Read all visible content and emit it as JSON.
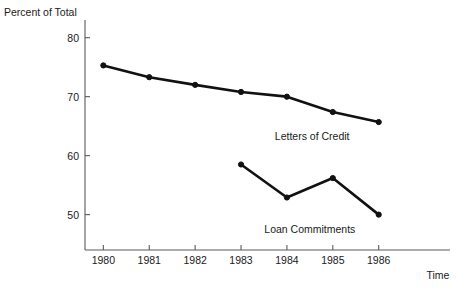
{
  "chart_data": {
    "type": "line",
    "title": "",
    "xlabel": "Time",
    "ylabel": "Percent of Total",
    "x": [
      1980,
      1981,
      1982,
      1983,
      1984,
      1985,
      1986
    ],
    "categories": [
      "1980",
      "1981",
      "1982",
      "1983",
      "1984",
      "1985",
      "1986"
    ],
    "xtick_labels": [
      "1980",
      "1981",
      "1982",
      "1983",
      "1984",
      "1985",
      "1986"
    ],
    "ytick_labels": [
      "80",
      "70",
      "60",
      "50"
    ],
    "yticks": [
      80,
      70,
      60,
      50
    ],
    "ylim": [
      44,
      83
    ],
    "xlim": [
      1979.6,
      1986.9
    ],
    "grid": false,
    "legend_position": "inline-annotation",
    "series": [
      {
        "name": "Letters of Credit",
        "x": [
          1980,
          1981,
          1982,
          1983,
          1984,
          1985,
          1986
        ],
        "values": [
          75.3,
          73.3,
          72.0,
          70.8,
          70.0,
          67.4,
          65.7
        ],
        "color": "#111111",
        "label_x": 1984.55,
        "label_y": 62.6
      },
      {
        "name": "Loan Commitments",
        "x": [
          1983,
          1984,
          1985,
          1986
        ],
        "values": [
          58.5,
          52.9,
          56.2,
          50.0
        ],
        "color": "#111111",
        "label_x": 1984.5,
        "label_y": 46.8
      }
    ],
    "annotations": [
      {
        "text": "Letters of Credit"
      },
      {
        "text": "Loan Commitments"
      }
    ]
  },
  "axes": {
    "y_title": "Percent of Total",
    "x_title": "Time"
  }
}
